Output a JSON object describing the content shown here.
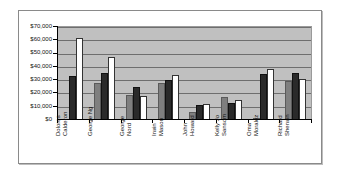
{
  "chart_data": {
    "type": "bar",
    "title": "",
    "xlabel": "",
    "ylabel": "",
    "ylim": [
      0,
      70000
    ],
    "yticks": [
      "$0",
      "$10,000",
      "$20,000",
      "$30,000",
      "$40,000",
      "$50,000",
      "$60,000",
      "$70,000"
    ],
    "grid": true,
    "legend": "none",
    "categories": [
      "Dolores Calderon",
      "George Ng",
      "George Nord",
      "Irwin Mason",
      "John Howard",
      "Kelly Jo Sansom",
      "Oma Moralez",
      "Richard Sherwin"
    ],
    "series": [
      {
        "name": "Series 1",
        "color": "#7f7f7f",
        "values": [
          0,
          28000,
          19000,
          28000,
          6000,
          17000,
          1000,
          29000
        ]
      },
      {
        "name": "Series 2",
        "color": "#2a2a2a",
        "values": [
          33000,
          35000,
          25000,
          30000,
          11000,
          13000,
          34500,
          35500
        ]
      },
      {
        "name": "Series 3",
        "color": "#ffffff",
        "values": [
          61500,
          47500,
          18000,
          34000,
          12000,
          15000,
          38500,
          30500
        ]
      }
    ]
  },
  "axis": {
    "y_labels": [
      "$70,000",
      "$60,000",
      "$50,000",
      "$40,000",
      "$30,000",
      "$20,000",
      "$10,000",
      "$0"
    ],
    "x_labels": [
      "Dolores\nCalderon",
      "George Ng",
      "George\nNord",
      "Irwin\nMason",
      "John\nHoward",
      "Kelly Jo\nSansom",
      "Oma\nMoralez",
      "Richard\nSherwin"
    ]
  }
}
